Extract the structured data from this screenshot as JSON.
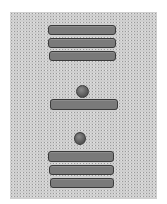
{
  "numerals": [
    {
      "name": "upper",
      "dots": 0,
      "bars": 3,
      "value": 15
    },
    {
      "name": "middle",
      "dots": 1,
      "bars": 1,
      "value": 6
    },
    {
      "name": "lower",
      "dots": 1,
      "bars": 3,
      "value": 16
    }
  ],
  "colors": {
    "bar_fill": "#7a7a7a",
    "bar_border": "#3a3a3a",
    "paper": "#d9d9d9"
  }
}
